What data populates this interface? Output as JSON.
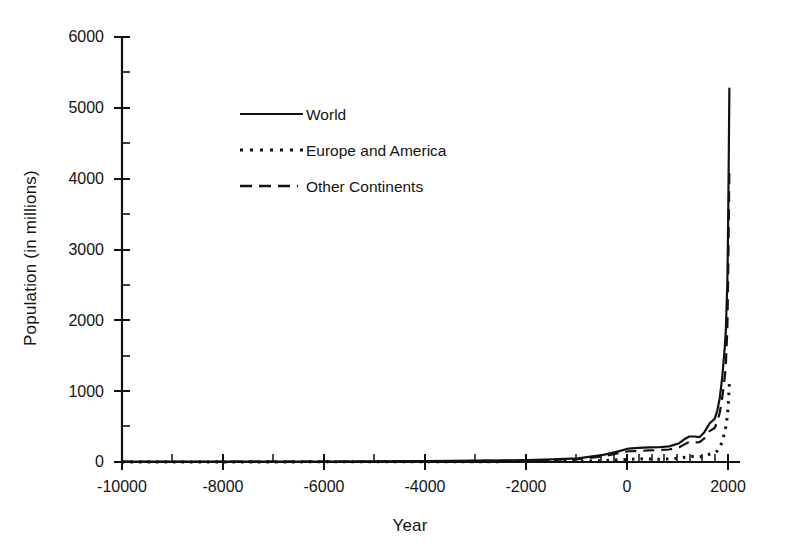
{
  "chart_data": {
    "type": "line",
    "title": "",
    "subtitle": "",
    "xlabel": "Year",
    "ylabel": "Population (in millions)",
    "xlim": [
      -10000,
      2200
    ],
    "ylim": [
      0,
      6000
    ],
    "grid": false,
    "legend_position": "upper-center-left",
    "x_ticks": [
      "-10000",
      "-8000",
      "-6000",
      "-4000",
      "-2000",
      "0",
      "2000"
    ],
    "x_tick_values": [
      -10000,
      -8000,
      -6000,
      -4000,
      -2000,
      0,
      2000
    ],
    "y_ticks": [
      "0",
      "1000",
      "2000",
      "3000",
      "4000",
      "5000",
      "6000"
    ],
    "y_tick_values": [
      0,
      1000,
      2000,
      3000,
      4000,
      5000,
      6000
    ],
    "series": [
      {
        "name": "World",
        "style": "solid",
        "color": "#111111",
        "x": [
          -10000,
          -8000,
          -6000,
          -5000,
          -4000,
          -3000,
          -2000,
          -1500,
          -1000,
          -500,
          -200,
          0,
          200,
          400,
          600,
          800,
          1000,
          1100,
          1200,
          1300,
          1400,
          1500,
          1600,
          1700,
          1750,
          1800,
          1850,
          1900,
          1920,
          1950,
          1960,
          1970,
          1980,
          1990
        ],
        "y": [
          4,
          5,
          7,
          9,
          12,
          20,
          27,
          38,
          50,
          100,
          150,
          190,
          200,
          206,
          208,
          220,
          265,
          320,
          360,
          360,
          350,
          425,
          545,
          610,
          720,
          900,
          1200,
          1625,
          1860,
          2525,
          3020,
          3700,
          4435,
          5270
        ]
      },
      {
        "name": "Europe and America",
        "style": "dotted",
        "color": "#111111",
        "x": [
          -10000,
          -8000,
          -6000,
          -4000,
          -2000,
          -1000,
          -500,
          0,
          200,
          400,
          600,
          800,
          1000,
          1200,
          1300,
          1400,
          1500,
          1600,
          1700,
          1750,
          1800,
          1850,
          1900,
          1920,
          1950,
          1960,
          1970,
          1980,
          1990
        ],
        "y": [
          1,
          1,
          2,
          3,
          6,
          10,
          20,
          38,
          45,
          42,
          40,
          44,
          56,
          75,
          82,
          70,
          88,
          110,
          130,
          155,
          205,
          290,
          425,
          500,
          645,
          730,
          830,
          970,
          1100
        ]
      },
      {
        "name": "Other Continents",
        "style": "dashed",
        "color": "#111111",
        "x": [
          -10000,
          -8000,
          -6000,
          -4000,
          -2000,
          -1000,
          -500,
          0,
          200,
          400,
          600,
          800,
          1000,
          1200,
          1300,
          1400,
          1500,
          1600,
          1700,
          1750,
          1800,
          1850,
          1900,
          1920,
          1950,
          1960,
          1970,
          1980,
          1990
        ],
        "y": [
          3,
          4,
          5,
          9,
          21,
          40,
          80,
          152,
          155,
          164,
          168,
          176,
          209,
          285,
          278,
          280,
          337,
          435,
          480,
          565,
          695,
          910,
          1200,
          1360,
          1880,
          2290,
          2870,
          3465,
          4170
        ]
      }
    ],
    "annotations": []
  },
  "legend": {
    "entries": [
      {
        "label": "World",
        "style": "solid"
      },
      {
        "label": "Europe and America",
        "style": "dotted"
      },
      {
        "label": "Other Continents",
        "style": "dashed"
      }
    ]
  },
  "axes": {
    "x_title": "Year",
    "y_title": "Population (in millions)"
  }
}
